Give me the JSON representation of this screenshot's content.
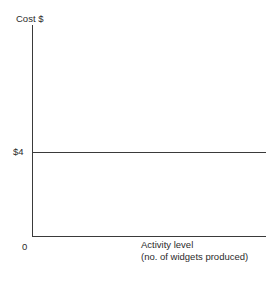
{
  "chart_data": {
    "type": "line",
    "title": "",
    "subtitle": "",
    "xlabel": "Activity level",
    "xlabel_sub": "(no. of widgets produced)",
    "ylabel": "Cost $",
    "origin_label": "0",
    "y_tick_labels": [
      "$4"
    ],
    "y_tick_values": [
      4
    ],
    "x": [
      0,
      100
    ],
    "series": [
      {
        "name": "Fixed cost per unit",
        "values": [
          4,
          4
        ],
        "color": "#3a3a3a"
      }
    ],
    "xlim": [
      0,
      100
    ],
    "ylim": [
      0,
      10
    ],
    "grid": false,
    "legend": false,
    "legend_position": "none",
    "annotations": []
  },
  "axes": {
    "y_axis_name": "cost-axis",
    "x_axis_name": "activity-axis",
    "line_color": "#3a3a3a"
  },
  "colors": {
    "background": "#ffffff",
    "ink": "#2b2b2b",
    "line": "#3a3a3a"
  }
}
